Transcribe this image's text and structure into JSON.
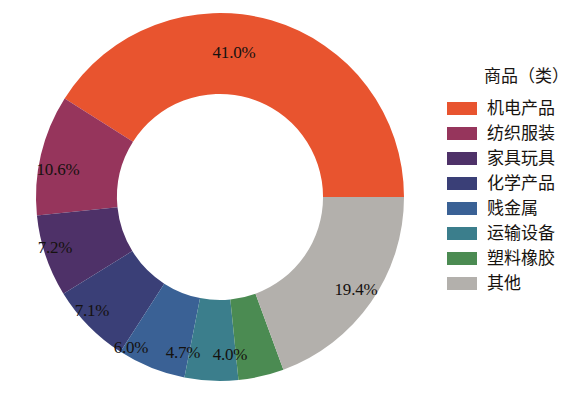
{
  "chart_data": {
    "type": "pie",
    "variant": "donut",
    "title": "",
    "legend_title": "商品（类）",
    "legend_position": "right",
    "grid": false,
    "units": "percent",
    "start_angle_deg": 0,
    "direction": "counterclockwise",
    "inner_radius_ratio": 0.56,
    "categories": [
      "机电产品",
      "纺织服装",
      "家具玩具",
      "化学产品",
      "贱金属",
      "运输设备",
      "塑料橡胶",
      "其他"
    ],
    "values": [
      41.0,
      10.6,
      7.2,
      7.1,
      6.0,
      4.7,
      4.0,
      19.4
    ],
    "labels": [
      "41.0%",
      "10.6%",
      "7.2%",
      "7.1%",
      "6.0%",
      "4.7%",
      "4.0%",
      "19.4%"
    ],
    "colors": [
      "#E8542F",
      "#96355C",
      "#4E3168",
      "#3A3F77",
      "#3A6195",
      "#3B7E8C",
      "#4B8B52",
      "#B3B0AC"
    ],
    "label_positions": [
      {
        "x": 234,
        "y": 53
      },
      {
        "x": 58,
        "y": 170
      },
      {
        "x": 55,
        "y": 248
      },
      {
        "x": 92,
        "y": 311
      },
      {
        "x": 131,
        "y": 348
      },
      {
        "x": 183,
        "y": 353
      },
      {
        "x": 230,
        "y": 355
      },
      {
        "x": 356,
        "y": 290
      }
    ]
  },
  "legend": {
    "title": "商品（类）",
    "items": [
      {
        "label": "机电产品",
        "color": "#E8542F"
      },
      {
        "label": "纺织服装",
        "color": "#96355C"
      },
      {
        "label": "家具玩具",
        "color": "#4E3168"
      },
      {
        "label": "化学产品",
        "color": "#3A3F77"
      },
      {
        "label": "贱金属",
        "color": "#3A6195"
      },
      {
        "label": "运输设备",
        "color": "#3B7E8C"
      },
      {
        "label": "塑料橡胶",
        "color": "#4B8B52"
      },
      {
        "label": "其他",
        "color": "#B3B0AC"
      }
    ]
  }
}
